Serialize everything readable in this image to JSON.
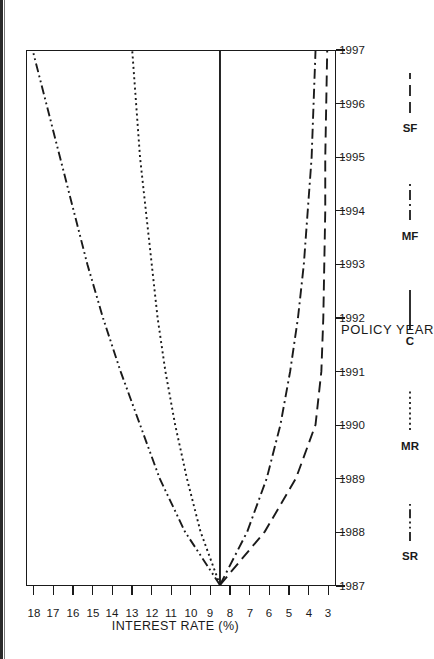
{
  "chart_data": {
    "type": "line",
    "title": "",
    "xlabel": "POLICY YEAR",
    "ylabel": "INTEREST RATE (%)",
    "x": [
      1987,
      1988,
      1989,
      1990,
      1991,
      1992,
      1993,
      1994,
      1995,
      1996,
      1997
    ],
    "xtick_labels": [
      "1987",
      "1988",
      "1989",
      "1990",
      "1991",
      "1992",
      "1993",
      "1994",
      "1995",
      "1996",
      "1997"
    ],
    "xlim": [
      1987,
      1997
    ],
    "ytick_labels": [
      "18",
      "17",
      "16",
      "15",
      "14",
      "13",
      "12",
      "11",
      "10",
      "9",
      "8",
      "7",
      "6",
      "5",
      "4",
      "3"
    ],
    "ytick_values": [
      18,
      17,
      16,
      15,
      14,
      13,
      12,
      11,
      10,
      9,
      8,
      7,
      6,
      5,
      4,
      3
    ],
    "ylim": [
      2.6,
      18.4
    ],
    "grid": false,
    "legend_position": "bottom",
    "series": [
      {
        "name": "SR",
        "label": "SR",
        "style": "dash-dot-dot",
        "values": [
          8.5,
          10.3,
          11.6,
          12.6,
          13.6,
          14.5,
          15.3,
          16.0,
          16.7,
          17.4,
          18.1
        ]
      },
      {
        "name": "MR",
        "label": "MR",
        "style": "dotted",
        "values": [
          8.5,
          9.5,
          10.2,
          10.8,
          11.3,
          11.7,
          12.0,
          12.3,
          12.6,
          12.8,
          13.0
        ]
      },
      {
        "name": "C",
        "label": "C",
        "style": "solid",
        "values": [
          8.5,
          8.5,
          8.5,
          8.5,
          8.5,
          8.5,
          8.5,
          8.5,
          8.5,
          8.5,
          8.5
        ]
      },
      {
        "name": "MF",
        "label": "MF",
        "style": "dash-dot",
        "values": [
          8.5,
          7.1,
          6.1,
          5.4,
          4.9,
          4.5,
          4.2,
          4.0,
          3.8,
          3.7,
          3.6
        ]
      },
      {
        "name": "SF",
        "label": "SF",
        "style": "long-dash",
        "values": [
          8.5,
          6.2,
          4.6,
          3.6,
          3.3,
          3.2,
          3.15,
          3.1,
          3.1,
          3.05,
          3.0
        ]
      }
    ]
  },
  "axes": {
    "x_title": "POLICY YEAR",
    "y_title": "INTEREST RATE (%)"
  },
  "legend": {
    "items": [
      {
        "label": "SR"
      },
      {
        "label": "MR"
      },
      {
        "label": "C"
      },
      {
        "label": "MF"
      },
      {
        "label": "SF"
      }
    ]
  },
  "colors": {
    "line": "#1a1a1a",
    "axis": "#1a1a1a",
    "background": "#ffffff"
  }
}
